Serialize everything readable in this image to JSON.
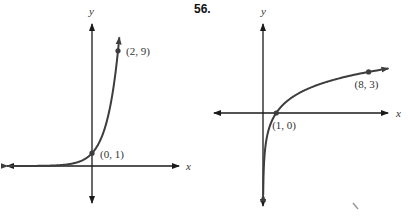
{
  "problem_number": "56.",
  "chart_data": [
    {
      "type": "line",
      "title": "",
      "function": "y = 3^x",
      "xlabel": "x",
      "ylabel": "y",
      "xlim": [
        -6.5,
        6.7
      ],
      "ylim": [
        -3.1,
        12
      ],
      "grid": false,
      "series": [
        {
          "name": "exponential",
          "points": [
            [
              -6.5,
              0.0008
            ],
            [
              -4,
              0.012
            ],
            [
              -2,
              0.111
            ],
            [
              -1,
              0.333
            ],
            [
              0,
              1
            ],
            [
              1,
              3
            ],
            [
              2,
              9
            ],
            [
              2.1,
              10
            ]
          ]
        }
      ],
      "labeled_points": [
        {
          "x": 0,
          "y": 1,
          "label": "(0, 1)"
        },
        {
          "x": 2,
          "y": 9,
          "label": "(2, 9)"
        }
      ]
    },
    {
      "type": "line",
      "title": "",
      "function": "y = log2(x)",
      "xlabel": "x",
      "ylabel": "y",
      "xlim": [
        -3.7,
        9.8
      ],
      "ylim": [
        -7,
        6.5
      ],
      "grid": false,
      "series": [
        {
          "name": "logarithmic",
          "points": [
            [
              0.015,
              -6.06
            ],
            [
              0.05,
              -4.32
            ],
            [
              0.125,
              -3
            ],
            [
              0.25,
              -2
            ],
            [
              0.5,
              -1
            ],
            [
              1,
              0
            ],
            [
              2,
              1
            ],
            [
              4,
              2
            ],
            [
              8,
              3
            ],
            [
              9.5,
              3.25
            ]
          ]
        }
      ],
      "labeled_points": [
        {
          "x": 1,
          "y": 0,
          "label": "(1, 0)"
        },
        {
          "x": 8,
          "y": 3,
          "label": "(8, 3)"
        }
      ]
    }
  ]
}
